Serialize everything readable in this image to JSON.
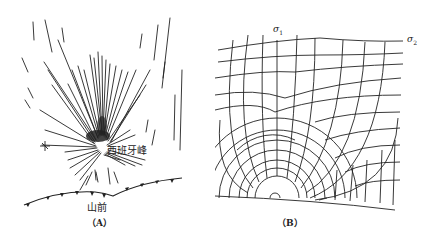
{
  "panel_a": {
    "peak_label": "西班牙峰",
    "front_label": "山前",
    "caption": "（A）"
  },
  "panel_b": {
    "sigma1_label": "σ",
    "sigma1_sub": "1",
    "sigma2_label": "σ",
    "sigma2_sub": "2",
    "caption": "（B）"
  },
  "colors": {
    "ink": "#222222",
    "background": "#ffffff"
  }
}
